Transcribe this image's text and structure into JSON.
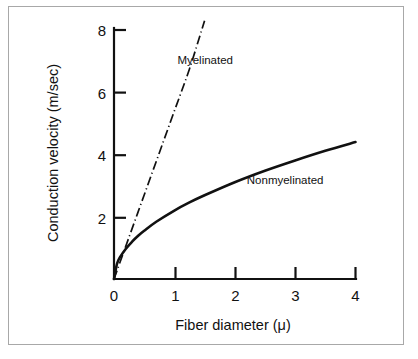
{
  "figure": {
    "background_color": "#ffffff",
    "frame_color": "#a8a8a8",
    "ink_color": "#111111"
  },
  "chart_data": {
    "type": "line",
    "title": "",
    "xlabel": "Fiber diameter (μ)",
    "ylabel": "Conduction velocity (m/sec)",
    "xlim": [
      0,
      4
    ],
    "ylim": [
      0,
      8
    ],
    "xticks": [
      0,
      1,
      2,
      3,
      4
    ],
    "xtick_labels": [
      "0",
      "1",
      "2",
      "3",
      "4"
    ],
    "yticks": [
      0,
      2,
      4,
      6,
      8
    ],
    "ytick_labels": [
      "0",
      "2",
      "4",
      "6",
      "8"
    ],
    "grid": false,
    "legend": "inline-annotations",
    "series": [
      {
        "name": "Myelinated",
        "style": "dash-dot",
        "color": "#111111",
        "label_position": {
          "x": 1.05,
          "y": 6.9
        },
        "x": [
          0.0,
          0.25,
          0.5,
          0.75,
          1.0,
          1.25,
          1.5
        ],
        "values": [
          0.0,
          1.35,
          2.7,
          4.05,
          5.4,
          6.75,
          8.3
        ]
      },
      {
        "name": "Nonmyelinated",
        "style": "solid",
        "color": "#111111",
        "label_position": {
          "x": 2.2,
          "y": 3.05
        },
        "x": [
          0.0,
          0.05,
          0.1,
          0.2,
          0.3,
          0.4,
          0.5,
          0.7,
          1.0,
          1.25,
          1.5,
          2.0,
          2.5,
          3.0,
          3.5,
          4.0
        ],
        "values": [
          0.0,
          0.49,
          0.7,
          0.98,
          1.2,
          1.39,
          1.55,
          1.84,
          2.2,
          2.46,
          2.69,
          3.11,
          3.48,
          3.81,
          4.12,
          4.4
        ]
      }
    ]
  },
  "annotations": {
    "myelinated_label": "Myelinated",
    "nonmyelinated_label": "Nonmyelinated"
  }
}
